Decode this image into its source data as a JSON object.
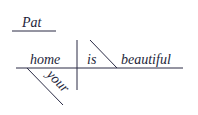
{
  "diagram": {
    "type": "sentence-diagram",
    "independent": "Pat",
    "subject": "home",
    "verb": "is",
    "complement": "beautiful",
    "modifier": "your",
    "colors": {
      "ink": "#1e1f3a"
    }
  }
}
